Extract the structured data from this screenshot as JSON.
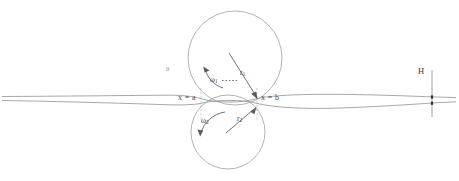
{
  "figure": {
    "background_color": "#ffffff",
    "line_color": "#909090",
    "label_color": "#3b3b3b"
  },
  "labels": {
    "x_equals_a": "x = a",
    "x_equals_b": "x = b",
    "omega_1": "ω",
    "omega_1_sub": "1",
    "omega_2": "ω",
    "omega_2_sub": "2",
    "r_1": "r",
    "r_1_sub": "1",
    "r_2": "r",
    "r_2_sub": "2",
    "H": "H",
    "theta": "θ"
  },
  "elements": {
    "upper_roll": {
      "name": "upper-roll",
      "center_x": 235,
      "center_y": 58,
      "radius": 47
    },
    "lower_roll": {
      "name": "lower-roll",
      "center_x": 228,
      "center_y": 132,
      "radius": 37
    },
    "strip": {
      "name": "workpiece-strip",
      "entry_side": "left",
      "exit_side": "right",
      "entry_thickness_label": "",
      "exit_thickness_label": "H"
    },
    "gap_boundaries": {
      "left_station": "x = a",
      "right_station": "x = b",
      "left_x": 201,
      "right_x": 257
    },
    "dimension_H": {
      "name": "exit-thickness-dimension",
      "x": 432,
      "top_y": 96,
      "bottom_y": 106
    }
  }
}
